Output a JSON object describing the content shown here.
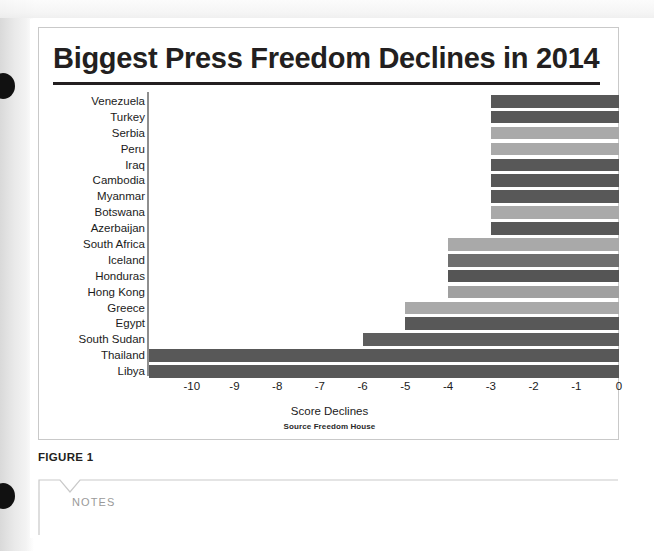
{
  "document": {
    "figure_label": "FIGURE 1",
    "notes_label": "NOTES"
  },
  "chart_data": {
    "type": "bar",
    "orientation": "horizontal",
    "title": "Biggest Press Freedom Declines in 2014",
    "xlabel": "Score Declines",
    "ylabel": "",
    "source": "Source Freedom House",
    "xlim": [
      -11,
      0
    ],
    "grid": false,
    "legend": "none",
    "tick_labels": [
      "-10",
      "-9",
      "-8",
      "-7",
      "-6",
      "-5",
      "-4",
      "-3",
      "-2",
      "-1",
      "0"
    ],
    "tick_values": [
      -10,
      -9,
      -8,
      -7,
      -6,
      -5,
      -4,
      -3,
      -2,
      -1,
      0
    ],
    "categories": [
      "Venezuela",
      "Turkey",
      "Serbia",
      "Peru",
      "Iraq",
      "Cambodia",
      "Myanmar",
      "Botswana",
      "Azerbaijan",
      "South Africa",
      "Iceland",
      "Honduras",
      "Hong Kong",
      "Greece",
      "Egypt",
      "South Sudan",
      "Thailand",
      "Libya"
    ],
    "values": [
      -3,
      -3,
      -3,
      -3,
      -3,
      -3,
      -3,
      -3,
      -3,
      -4,
      -4,
      -4,
      -4,
      -5,
      -5,
      -6,
      -11,
      -11
    ],
    "bar_colors": [
      "#585858",
      "#585858",
      "#a9a9a9",
      "#a9a9a9",
      "#585858",
      "#585858",
      "#585858",
      "#a9a9a9",
      "#585858",
      "#a9a9a9",
      "#6f6f6f",
      "#555555",
      "#a0a0a0",
      "#a9a9a9",
      "#585858",
      "#5e5e5e",
      "#585858",
      "#585858"
    ]
  },
  "colors": {
    "title_text": "#231f20",
    "rule": "#231f20",
    "axis": "#8e8e8e",
    "bar_dark": "#585858",
    "bar_light": "#a9a9a9",
    "card_border": "#c9c9c9",
    "notes_text": "#9a9a9a"
  }
}
